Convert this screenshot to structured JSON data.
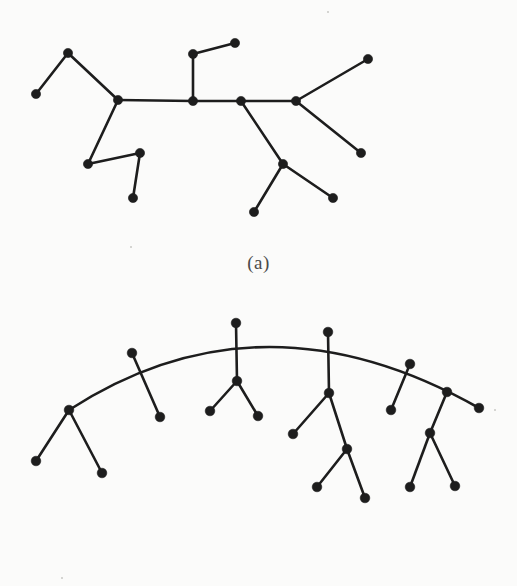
{
  "page": {
    "background_color": "#fbfbfa",
    "ink_color": "#1d1d1d",
    "width": 517,
    "height": 586
  },
  "figure": {
    "panels": [
      {
        "id": "a",
        "caption": "(a)",
        "kind": "node-link-tree-straight-spine",
        "node_radius": 4.6,
        "edge_width": 2.6,
        "nodes": [
          {
            "id": "a1",
            "name": "leaf-upper-left",
            "x": 36,
            "y": 94
          },
          {
            "id": "a2",
            "name": "branch-upper-left",
            "x": 68,
            "y": 53
          },
          {
            "id": "a3",
            "name": "spine-left-junction",
            "x": 118,
            "y": 100
          },
          {
            "id": "a4",
            "name": "spine-center-node",
            "x": 193,
            "y": 101
          },
          {
            "id": "a5",
            "name": "stem-above-center",
            "x": 193,
            "y": 54
          },
          {
            "id": "a6",
            "name": "leaf-top-center-right",
            "x": 235,
            "y": 43
          },
          {
            "id": "a7",
            "name": "spine-mid-right-node",
            "x": 241,
            "y": 101
          },
          {
            "id": "a8",
            "name": "spine-right-junction",
            "x": 296,
            "y": 101
          },
          {
            "id": "a9",
            "name": "leaf-upper-right",
            "x": 368,
            "y": 59
          },
          {
            "id": "a10",
            "name": "leaf-lower-right",
            "x": 361,
            "y": 153
          },
          {
            "id": "a11",
            "name": "branch-lower-right",
            "x": 283,
            "y": 164
          },
          {
            "id": "a12",
            "name": "leaf-bottom-center",
            "x": 254,
            "y": 212
          },
          {
            "id": "a13",
            "name": "leaf-bottom-right",
            "x": 333,
            "y": 198
          },
          {
            "id": "a14",
            "name": "branch-lower-left",
            "x": 88,
            "y": 164
          },
          {
            "id": "a15",
            "name": "branch-lower-left-hook",
            "x": 140,
            "y": 153
          },
          {
            "id": "a16",
            "name": "leaf-bottom-left",
            "x": 133,
            "y": 198
          }
        ],
        "edges": [
          [
            "a1",
            "a2"
          ],
          [
            "a2",
            "a3"
          ],
          [
            "a3",
            "a4"
          ],
          [
            "a4",
            "a7"
          ],
          [
            "a7",
            "a8"
          ],
          [
            "a4",
            "a5"
          ],
          [
            "a5",
            "a6"
          ],
          [
            "a8",
            "a9"
          ],
          [
            "a8",
            "a10"
          ],
          [
            "a7",
            "a11"
          ],
          [
            "a11",
            "a12"
          ],
          [
            "a11",
            "a13"
          ],
          [
            "a3",
            "a14"
          ],
          [
            "a14",
            "a15"
          ],
          [
            "a15",
            "a16"
          ]
        ]
      },
      {
        "id": "b",
        "caption": "(b)",
        "kind": "node-link-tree-arc-spine",
        "node_radius": 4.8,
        "edge_width": 2.6,
        "arc": {
          "name": "curved-spine-arc",
          "start": {
            "x": 69,
            "y": 410
          },
          "end": {
            "x": 479,
            "y": 408
          },
          "apex": {
            "x": 236,
            "y": 323
          },
          "control": {
            "x": 262,
            "y": 285
          }
        },
        "nodes": [
          {
            "id": "b1",
            "name": "arc-left-end-junction",
            "x": 69,
            "y": 410,
            "on_arc": true
          },
          {
            "id": "b2",
            "name": "leaf-far-left",
            "x": 36,
            "y": 461
          },
          {
            "id": "b3",
            "name": "leaf-left-lower",
            "x": 102,
            "y": 473
          },
          {
            "id": "b4",
            "name": "arc-node-left",
            "x": 132,
            "y": 353,
            "on_arc": true
          },
          {
            "id": "b5",
            "name": "leaf-left-mid",
            "x": 160,
            "y": 417
          },
          {
            "id": "b6",
            "name": "arc-apex-node",
            "x": 236,
            "y": 323,
            "on_arc": true
          },
          {
            "id": "b7",
            "name": "branch-center",
            "x": 237,
            "y": 381
          },
          {
            "id": "b8",
            "name": "leaf-center-left",
            "x": 210,
            "y": 411
          },
          {
            "id": "b9",
            "name": "leaf-center-right",
            "x": 258,
            "y": 416
          },
          {
            "id": "b10",
            "name": "arc-node-center-right",
            "x": 328,
            "y": 332,
            "on_arc": true
          },
          {
            "id": "b11",
            "name": "branch-right-upper",
            "x": 329,
            "y": 393
          },
          {
            "id": "b12",
            "name": "leaf-right-upper-left",
            "x": 293,
            "y": 434
          },
          {
            "id": "b13",
            "name": "branch-right-lower",
            "x": 347,
            "y": 449
          },
          {
            "id": "b14",
            "name": "leaf-right-lower-left",
            "x": 317,
            "y": 487
          },
          {
            "id": "b15",
            "name": "leaf-right-lower-right",
            "x": 365,
            "y": 498
          },
          {
            "id": "b16",
            "name": "arc-node-right",
            "x": 410,
            "y": 364,
            "on_arc": true
          },
          {
            "id": "b17",
            "name": "leaf-far-right-upper",
            "x": 391,
            "y": 410
          },
          {
            "id": "b18",
            "name": "arc-node-far-right",
            "x": 447,
            "y": 392,
            "on_arc": true
          },
          {
            "id": "b19",
            "name": "arc-right-end-leaf",
            "x": 479,
            "y": 408,
            "on_arc": true
          },
          {
            "id": "b20",
            "name": "branch-far-right",
            "x": 430,
            "y": 433
          },
          {
            "id": "b21",
            "name": "leaf-far-right-bottom-l",
            "x": 410,
            "y": 487
          },
          {
            "id": "b22",
            "name": "leaf-far-right-bottom-r",
            "x": 455,
            "y": 486
          }
        ],
        "edges": [
          [
            "b1",
            "b2"
          ],
          [
            "b1",
            "b3"
          ],
          [
            "b4",
            "b5"
          ],
          [
            "b6",
            "b7"
          ],
          [
            "b7",
            "b8"
          ],
          [
            "b7",
            "b9"
          ],
          [
            "b10",
            "b11"
          ],
          [
            "b11",
            "b12"
          ],
          [
            "b11",
            "b13"
          ],
          [
            "b13",
            "b14"
          ],
          [
            "b13",
            "b15"
          ],
          [
            "b16",
            "b17"
          ],
          [
            "b18",
            "b20"
          ],
          [
            "b20",
            "b21"
          ],
          [
            "b20",
            "b22"
          ]
        ]
      }
    ]
  },
  "specks": [
    {
      "x": 328,
      "y": 12,
      "r": 1.4
    },
    {
      "x": 131,
      "y": 247,
      "r": 1.2
    },
    {
      "x": 495,
      "y": 410,
      "r": 1.3
    },
    {
      "x": 62,
      "y": 578,
      "r": 1.2
    }
  ]
}
